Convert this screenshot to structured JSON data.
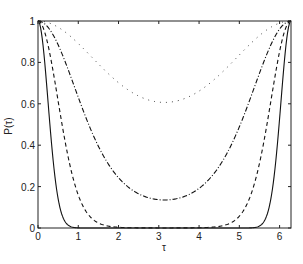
{
  "chart_data": {
    "type": "line",
    "title": "",
    "xlabel": "τ",
    "ylabel": "P(τ)",
    "xlim": [
      0,
      6.2832
    ],
    "ylim": [
      0,
      1
    ],
    "grid": false,
    "legend": null,
    "xticks": [
      0,
      1,
      2,
      3,
      4,
      5,
      6
    ],
    "yticks": [
      0,
      0.2,
      0.4,
      0.6,
      0.8,
      1
    ],
    "xtick_labels": [
      "0",
      "1",
      "2",
      "3",
      "4",
      "5",
      "6"
    ],
    "ytick_labels": [
      "0",
      "0.2",
      "0.4",
      "0.6",
      "0.8",
      "1"
    ],
    "series": [
      {
        "name": "dotted",
        "style": "dotted",
        "min_value": 0.61,
        "min_at": 3.14,
        "x": [
          0,
          0.5,
          1.0,
          1.5,
          2.0,
          2.5,
          3.14,
          3.8,
          4.3,
          4.8,
          5.3,
          5.8,
          6.28
        ],
        "values": [
          1.0,
          0.97,
          0.89,
          0.79,
          0.71,
          0.65,
          0.61,
          0.65,
          0.71,
          0.79,
          0.89,
          0.97,
          1.0
        ]
      },
      {
        "name": "dash-dot",
        "style": "dashdot",
        "min_value": 0.135,
        "min_at": 3.14,
        "x": [
          0,
          0.5,
          1.0,
          1.5,
          2.0,
          2.5,
          3.14,
          3.8,
          4.3,
          4.8,
          5.3,
          5.8,
          6.28
        ],
        "values": [
          1.0,
          0.88,
          0.63,
          0.39,
          0.24,
          0.16,
          0.135,
          0.16,
          0.24,
          0.39,
          0.63,
          0.88,
          1.0
        ]
      },
      {
        "name": "dashed",
        "style": "dashed",
        "min_value": 0.0,
        "min_at": 3.14,
        "x": [
          0,
          0.5,
          1.0,
          1.5,
          2.0,
          2.5,
          3.14,
          3.8,
          4.3,
          4.8,
          5.3,
          5.8,
          6.28
        ],
        "values": [
          1.0,
          0.61,
          0.16,
          0.02,
          0.0,
          0.0,
          0.0,
          0.0,
          0.0,
          0.02,
          0.16,
          0.61,
          1.0
        ]
      },
      {
        "name": "solid",
        "style": "solid",
        "min_value": 0.0,
        "min_at": 3.14,
        "x": [
          0,
          0.2,
          0.4,
          0.6,
          0.8,
          1.0,
          3.14,
          5.28,
          5.48,
          5.68,
          5.88,
          6.08,
          6.28
        ],
        "values": [
          1.0,
          0.73,
          0.28,
          0.06,
          0.01,
          0.0,
          0.0,
          0.0,
          0.01,
          0.06,
          0.28,
          0.73,
          1.0
        ]
      }
    ],
    "model_params": {
      "dotted": 0.25,
      "dash-dot": 1,
      "dashed": 4,
      "solid": 16
    }
  }
}
